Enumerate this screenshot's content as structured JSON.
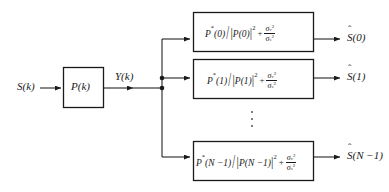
{
  "diagram": {
    "background_color": "#ffffff",
    "line_color": "#1a1a1a",
    "input_label": "S(k)",
    "system_block_label": "P(k)",
    "intermediate_label": "Y(k)",
    "vertical_ellipsis": "⋮",
    "branches": [
      {
        "id": "branch-0",
        "index": "0",
        "numerator": "P",
        "numerator_star": "*",
        "numerator_arg": "(0)",
        "denominator_mod": "P(0)",
        "denominator_exp": "2",
        "noise_sigma": "σ",
        "noise_sub": "v",
        "noise_exp": "2",
        "signal_sigma": "σ",
        "signal_sub": "s",
        "signal_exp": "2",
        "output_label": "S(0)"
      },
      {
        "id": "branch-1",
        "index": "1",
        "numerator": "P",
        "numerator_star": "*",
        "numerator_arg": "(1)",
        "denominator_mod": "P(1)",
        "denominator_exp": "2",
        "noise_sigma": "σ",
        "noise_sub": "v",
        "noise_exp": "2",
        "signal_sigma": "σ",
        "signal_sub": "s",
        "signal_exp": "2",
        "output_label": "S(1)"
      },
      {
        "id": "branch-n",
        "index": "N−1",
        "numerator": "P",
        "numerator_star": "*",
        "numerator_arg": "(N −1)",
        "denominator_mod": "P(N −1)",
        "denominator_exp": "2",
        "noise_sigma": "σ",
        "noise_sub": "v",
        "noise_exp": "2",
        "signal_sigma": "σ",
        "signal_sub": "s",
        "signal_exp": "2",
        "output_label": "S(N −1)"
      }
    ]
  }
}
